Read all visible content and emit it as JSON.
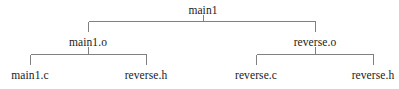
{
  "diagram": {
    "type": "dependency-tree",
    "background_color": "#ffffff",
    "line_color": "#808080",
    "text_color": "#1a1a1a",
    "nodes": [
      {
        "id": "main1",
        "label": "main1",
        "level": 0,
        "x": 203,
        "y": 11
      },
      {
        "id": "main1-o",
        "label": "main1.o",
        "level": 1,
        "x": 88,
        "y": 43
      },
      {
        "id": "reverse-o",
        "label": "reverse.o",
        "level": 1,
        "x": 315,
        "y": 43
      },
      {
        "id": "main1-c",
        "label": "main1.c",
        "level": 2,
        "x": 30,
        "y": 76
      },
      {
        "id": "reverse-h-1",
        "label": "reverse.h",
        "level": 2,
        "x": 146,
        "y": 76
      },
      {
        "id": "reverse-c",
        "label": "reverse.c",
        "level": 2,
        "x": 256,
        "y": 76
      },
      {
        "id": "reverse-h-2",
        "label": "reverse.h",
        "level": 2,
        "x": 373,
        "y": 76
      }
    ],
    "edges": [
      {
        "from": "main1",
        "to": "main1-o"
      },
      {
        "from": "main1",
        "to": "reverse-o"
      },
      {
        "from": "main1-o",
        "to": "main1-c"
      },
      {
        "from": "main1-o",
        "to": "reverse-h-1"
      },
      {
        "from": "reverse-o",
        "to": "reverse-c"
      },
      {
        "from": "reverse-o",
        "to": "reverse-h-2"
      }
    ],
    "connectors": {
      "top": {
        "bar_y": 21,
        "bar_x1": 88,
        "bar_x2": 315,
        "parent_x": 203,
        "parent_stub_top": 14,
        "child_stub_bottom": 31
      },
      "left_group": {
        "bar_y": 54,
        "bar_x1": 30,
        "bar_x2": 146,
        "parent_x": 88,
        "parent_stub_top": 46,
        "child_stub_bottom": 64
      },
      "right_group": {
        "bar_y": 54,
        "bar_x1": 256,
        "bar_x2": 373,
        "parent_x": 315,
        "parent_stub_top": 46,
        "child_stub_bottom": 64
      }
    }
  }
}
